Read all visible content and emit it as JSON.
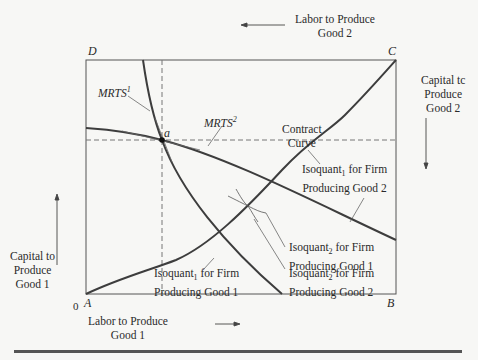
{
  "diagram": {
    "type": "edgeworth-box-production",
    "corners": {
      "bottom_left": "A",
      "bottom_right": "B",
      "top_right": "C",
      "top_left": "D",
      "origin_label": "0"
    },
    "point": {
      "label": "a"
    },
    "axes": {
      "bottom": {
        "line1": "Labor to Produce",
        "line2": "Good 1",
        "arrow": "right"
      },
      "top": {
        "line1": "Labor to Produce",
        "line2": "Good 2",
        "arrow": "left"
      },
      "left": {
        "line1": "Capital to",
        "line2": "Produce",
        "line3": "Good 1",
        "arrow": "up"
      },
      "right": {
        "line1": "Capital tc",
        "line2": "Produce",
        "line3": "Good 2",
        "arrow": "down"
      }
    },
    "labels": {
      "mrts1": {
        "base": "MRTS",
        "sup": "1"
      },
      "mrts2": {
        "base": "MRTS",
        "sup": "2"
      },
      "contract_curve": {
        "line1": "Contract",
        "line2": "Curve"
      },
      "iso1_good2": {
        "base": "Isoquant",
        "sub": "1",
        "rest": " for Firm",
        "line2": "Producing Good 2"
      },
      "iso2_good1": {
        "base": "Isoquant",
        "sub": "2",
        "rest": " for Firm",
        "line2": "Producing Good 1"
      },
      "iso2_good2": {
        "base": "Isoquant",
        "sub": "2",
        "rest": " for Firm",
        "line2": "Producing Good 2"
      },
      "iso1_good1": {
        "base": "Isoquant",
        "sub": "1",
        "rest": " for Firm",
        "line2": "Producing Good 1"
      }
    },
    "colors": {
      "curve": "#3d3d3d",
      "box": "#555555",
      "dashed": "#777777",
      "text": "#2a2a2a"
    }
  }
}
